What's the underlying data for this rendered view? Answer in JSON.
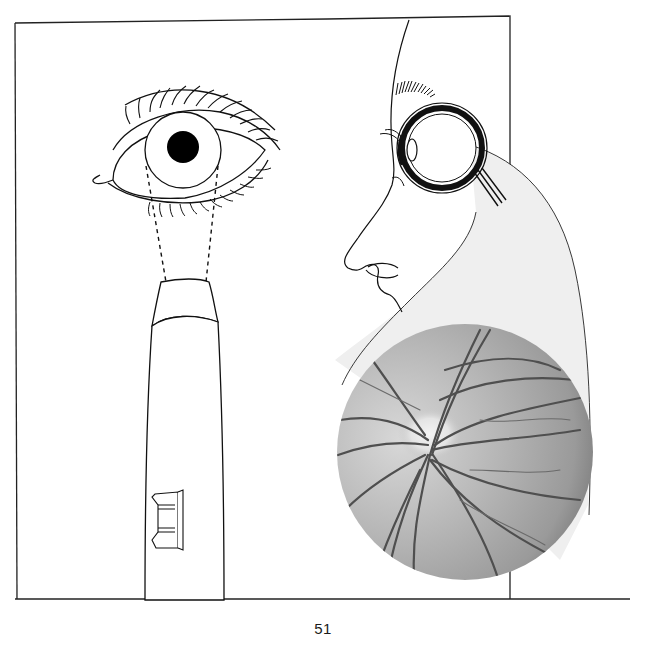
{
  "page": {
    "number": "51"
  },
  "figure": {
    "panels": [
      {
        "name": "frontal-eye",
        "description": "frontal view of an eye with upper and lower lashes, iris and black pupil"
      },
      {
        "name": "ophthalmoscope",
        "description": "handheld ophthalmoscope with light beam (dashed lines) directed into the pupil, switch on its handle"
      },
      {
        "name": "profile-face-eyeball",
        "description": "side profile of a face with cross-section of eyeball and optic nerve"
      },
      {
        "name": "fundus-photo",
        "description": "grayscale photograph of the retina showing optic disc and blood vessels"
      }
    ],
    "colors": {
      "line": "#111111",
      "callout_fill": "#efefef",
      "fundus_light": "#cfcfcf",
      "fundus_dark": "#6e6e6e",
      "vessel": "#4a4a4a"
    }
  }
}
